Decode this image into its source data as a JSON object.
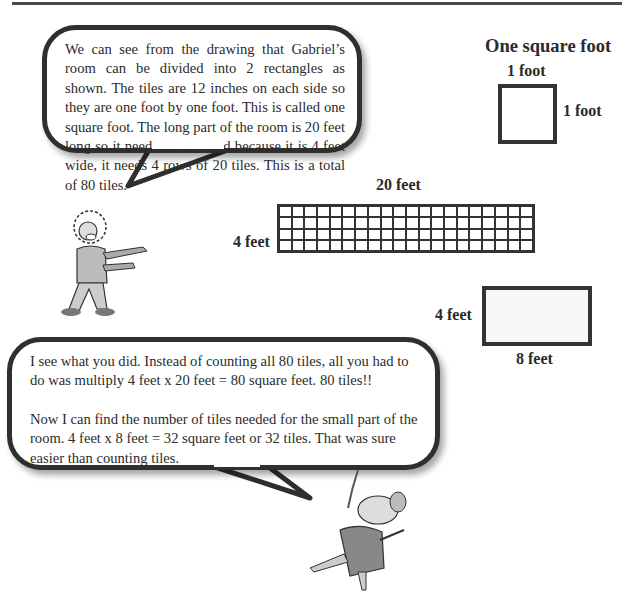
{
  "bubble_top": {
    "speaker": "old-man",
    "text": "We can see from the drawing that Gabriel’s room can be divided into 2 rectangles as shown. The tiles are 12 inches on each side so they are one foot by one foot. This is called one square foot. The long part of the room is 20 feet long so it needs 20 tiles and because it is 4 feet wide, it needs 4 rows of 20 tiles. This is a total of 80 tiles."
  },
  "bubble_bottom": {
    "speaker": "mouse",
    "paragraph1": "I see what you did. Instead of counting all 80 tiles, all you had to do was multiply 4 feet x 20 feet = 80 square feet. 80 tiles!!",
    "paragraph2": "Now I can find the number of tiles needed for the small part of the room. 4 feet x 8 feet = 32 square feet or 32 tiles. That was sure easier than counting tiles."
  },
  "square_foot_diagram": {
    "title": "One square foot",
    "top_label": "1 foot",
    "side_label": "1 foot"
  },
  "large_rectangle": {
    "top_label": "20 feet",
    "side_label": "4 feet",
    "columns": 20,
    "rows": 4
  },
  "small_rectangle": {
    "side_label": "4 feet",
    "bottom_label": "8 feet"
  }
}
